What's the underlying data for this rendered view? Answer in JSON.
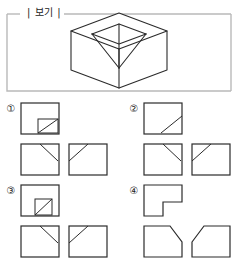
{
  "example": {
    "label": "| 보기 |",
    "figure_name": "cube-with-inverted-pyramid-notch",
    "border_color": "#b9b9b9",
    "line_color": "#2b2b2b"
  },
  "options": [
    {
      "marker": "①",
      "top_shape": "square-with-small-square-and-diagonal-lower-right",
      "bottom_left_shape": "square-with-short-diagonal-from-top-center-down-right",
      "bottom_right_shape": "square-with-diagonal-from-top-right-down-left"
    },
    {
      "marker": "②",
      "top_shape": "square-with-single-diagonal-lower-right",
      "bottom_left_shape": "square-with-short-diagonal-from-top-center-down-right",
      "bottom_right_shape": "square-with-diagonal-from-top-right-down-left"
    },
    {
      "marker": "③",
      "top_shape": "square-with-inner-small-square-center-and-diagonal",
      "bottom_left_shape": "square-with-short-diagonal-from-top-center-down-right",
      "bottom_right_shape": "square-with-diagonal-from-top-right-down-left"
    },
    {
      "marker": "④",
      "top_shape": "l-shaped-notched-square",
      "bottom_left_shape": "pentagon-chamfered-top-right-corner",
      "bottom_right_shape": "pentagon-chamfered-top-left-corner"
    }
  ],
  "style": {
    "stroke": "#2b2b2b",
    "frame_stroke": "#b9b9b9",
    "fill": "#ffffff"
  }
}
